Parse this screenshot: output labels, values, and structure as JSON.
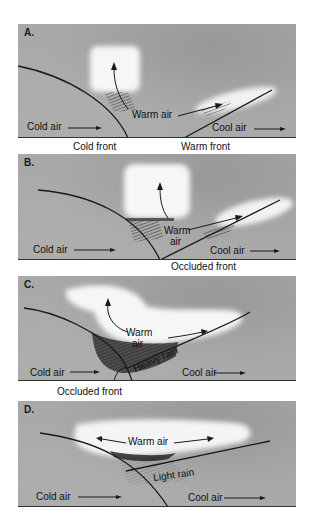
{
  "panels": [
    {
      "id": "A",
      "label": "A.",
      "labels": {
        "warm_air": "Warm air",
        "cold_air": "Cold air",
        "cool_air": "Cool air"
      },
      "captions": {
        "cold_front": "Cold front",
        "warm_front": "Warm front"
      }
    },
    {
      "id": "B",
      "label": "B.",
      "labels": {
        "warm_air_1": "Warm",
        "warm_air_2": "air",
        "cold_air": "Cold air",
        "cool_air": "Cool air"
      },
      "captions": {
        "occluded_front": "Occluded front"
      }
    },
    {
      "id": "C",
      "label": "C.",
      "labels": {
        "warm_air_1": "Warm",
        "warm_air_2": "air",
        "heavy_rain": "Heavy rain",
        "cold_air": "Cold air",
        "cool_air": "Cool air"
      },
      "captions": {
        "occluded_front": "Occluded front"
      }
    },
    {
      "id": "D",
      "label": "D.",
      "labels": {
        "warm_air": "Warm air",
        "light_rain": "Light rain",
        "cold_air": "Cold air",
        "cool_air": "Cool air"
      }
    }
  ],
  "colors": {
    "panel_bg": "#a9a9a9",
    "cloud": "#f4f4f4",
    "line": "#1a1a1a",
    "rain": "#3a3a3a"
  }
}
